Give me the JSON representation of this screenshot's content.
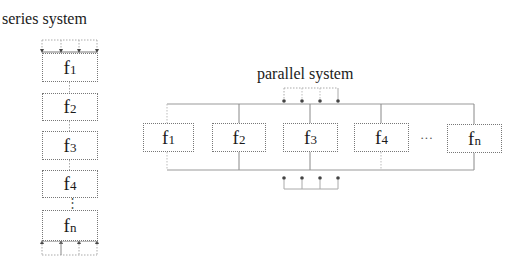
{
  "series_system": {
    "title": "series system",
    "blocks": [
      {
        "base": "f",
        "sub": "1"
      },
      {
        "base": "f",
        "sub": "2"
      },
      {
        "base": "f",
        "sub": "3"
      },
      {
        "base": "f",
        "sub": "4"
      },
      {
        "base": "f",
        "sub": "n"
      }
    ],
    "ellipsis": "⋮"
  },
  "parallel_system": {
    "title": "parallel system",
    "blocks": [
      {
        "base": "f",
        "sub": "1"
      },
      {
        "base": "f",
        "sub": "2"
      },
      {
        "base": "f",
        "sub": "3"
      },
      {
        "base": "f",
        "sub": "4"
      },
      {
        "base": "f",
        "sub": "n"
      }
    ],
    "ellipsis": "···"
  },
  "colors": {
    "line": "#999999",
    "box_border": "#777777",
    "text": "#1a1a1a"
  }
}
